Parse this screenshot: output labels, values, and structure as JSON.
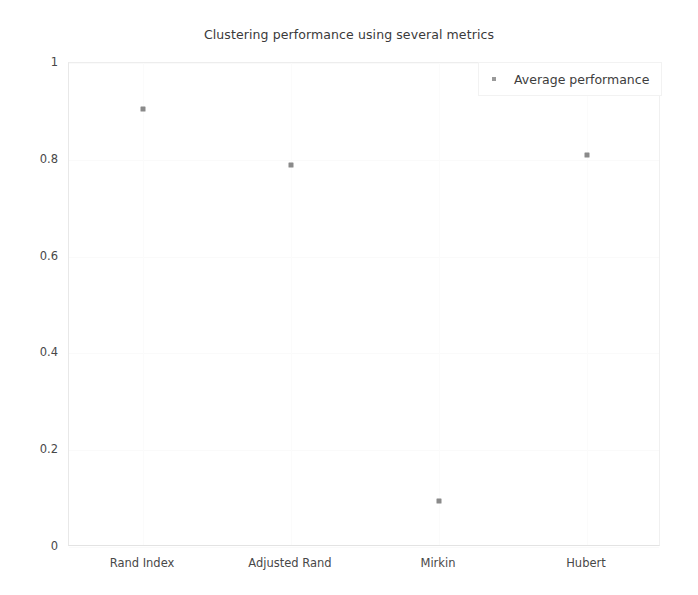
{
  "chart_data": {
    "type": "scatter",
    "title": "Clustering performance using several metrics",
    "xlabel": "",
    "ylabel": "",
    "categories": [
      "Rand Index",
      "Adjusted Rand",
      "Mirkin",
      "Hubert"
    ],
    "series": [
      {
        "name": "Average performance",
        "values": [
          0.905,
          0.79,
          0.095,
          0.81
        ],
        "marker": "square-dot",
        "color": "#8a8a8a"
      }
    ],
    "ylim": [
      0,
      1
    ],
    "yticks": [
      "0",
      "0.2",
      "0.4",
      "0.6",
      "0.8",
      "1"
    ],
    "ytick_values": [
      0,
      0.2,
      0.4,
      0.6,
      0.8,
      1
    ],
    "grid": "faint",
    "legend_position": "top-right",
    "background_color": "#ffffff"
  },
  "legend": {
    "entries": [
      {
        "label": "Average performance",
        "marker_color": "#9a9a9a"
      }
    ]
  }
}
